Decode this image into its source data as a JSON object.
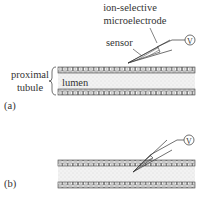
{
  "labels": {
    "electrode": [
      "ion-selective",
      "microelectrode"
    ],
    "sensor": "sensor",
    "tubule": [
      "proximal",
      "tubule"
    ],
    "lumen": "lumen",
    "panel_a": "(a)",
    "panel_b": "(b)",
    "voltmeter": "V"
  },
  "colors": {
    "ink": "#333333",
    "lumen_fill": "#e6e6e6",
    "wall_fill": "#ffffff"
  }
}
